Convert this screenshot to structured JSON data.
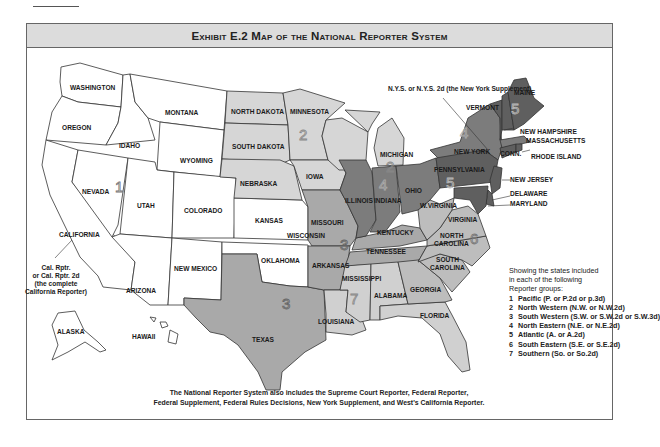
{
  "header": {
    "title": "Exhibit E.2  Map of the National Reporter System"
  },
  "colors": {
    "frame_header_bg": "#dcdcdc",
    "group_1_pacific": "#ffffff",
    "group_2_north_western": "#d6d6d6",
    "group_3_south_western": "#a9a9a9",
    "group_4_north_eastern": "#7c7c7c",
    "group_5_atlantic": "#5f5f5f",
    "group_6_south_eastern": "#bdbdbd",
    "group_7_southern": "#d0d0d0"
  },
  "map": {
    "states": {
      "washington": "WASHINGTON",
      "oregon": "OREGON",
      "california": "CALIFORNIA",
      "nevada": "NEVADA",
      "idaho": "IDAHO",
      "montana": "MONTANA",
      "wyoming": "WYOMING",
      "utah": "UTAH",
      "colorado": "COLORADO",
      "arizona": "ARIZONA",
      "new_mexico": "NEW MEXICO",
      "alaska": "ALASKA",
      "hawaii": "HAWAII",
      "kansas": "KANSAS",
      "oklahoma": "OKLAHOMA",
      "north_dakota": "NORTH DAKOTA",
      "south_dakota": "SOUTH DAKOTA",
      "nebraska": "NEBRASKA",
      "minnesota": "MINNESOTA",
      "iowa": "IOWA",
      "wisconsin": "WISCONSIN",
      "michigan": "MICHIGAN",
      "texas": "TEXAS",
      "missouri": "MISSOURI",
      "arkansas": "ARKANSAS",
      "tennessee": "TENNESSEE",
      "kentucky": "KENTUCKY",
      "louisiana": "LOUISIANA",
      "illinois": "ILLINOIS",
      "indiana": "INDIANA",
      "ohio": "OHIO",
      "new_york": "NEW YORK",
      "massachusetts": "MASSACHUSETTS",
      "pennsylvania": "PENNSYLVANIA",
      "new_jersey": "NEW JERSEY",
      "delaware": "DELAWARE",
      "maryland": "MARYLAND",
      "maine": "MAINE",
      "vermont": "VERMONT",
      "new_hampshire": "NEW HAMPSHIRE",
      "rhode_island": "RHODE ISLAND",
      "connecticut": "CONN.",
      "west_virginia": "W.VIRGINIA",
      "virginia": "VIRGINIA",
      "north_carolina": "NORTH CAROLINA",
      "south_carolina": "SOUTH CAROLINA",
      "georgia": "GEORGIA",
      "mississippi": "MISSISSIPPI",
      "alabama": "ALABAMA",
      "florida": "FLORIDA"
    },
    "region_numbers": {
      "g1": "1",
      "g2a": "2",
      "g2b": "2",
      "g3a": "3",
      "g3b": "3",
      "g4a": "4",
      "g4b": "4",
      "g5a": "5",
      "g5b": "5",
      "g6": "6",
      "g7": "7"
    },
    "callouts": {
      "nys": "N.Y.S. or N.Y.S. 2d (the New York Supplement)",
      "cal_1": "Cal. Rptr.",
      "cal_2": "or Cal. Rptr. 2d",
      "cal_3": "(the complete",
      "cal_4": "California Reporter)"
    }
  },
  "legend": {
    "intro": [
      "Showing the states included",
      "in each of the following",
      "Reporter groups:"
    ],
    "items": [
      {
        "number": "1",
        "label": "Pacific (P. or P.2d or p.3d)"
      },
      {
        "number": "2",
        "label": "North Western (N.W. or N.W.2d)"
      },
      {
        "number": "3",
        "label": "South Western (S.W. or S.W.2d or S.W.3d)"
      },
      {
        "number": "4",
        "label": "North Eastern (N.E. or N.E.2d)"
      },
      {
        "number": "5",
        "label": "Atlantic (A. or A.2d)"
      },
      {
        "number": "6",
        "label": "South Eastern (S.E. or S.E.2d)"
      },
      {
        "number": "7",
        "label": "Southern (So. or So.2d)"
      }
    ]
  },
  "footnote": {
    "line1": "The National Reporter System also includes the Supreme Court Reporter, Federal Reporter,",
    "line2": "Federal Supplement, Federal Rules Decisions, New York Supplement, and West's California Reporter."
  }
}
